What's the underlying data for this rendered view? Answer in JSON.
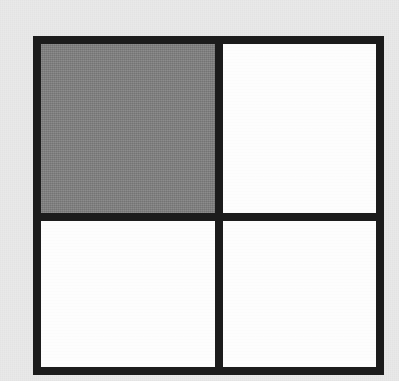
{
  "figure": {
    "kind": "fraction-area-model",
    "rows": 2,
    "columns": 2,
    "total_cells": 4,
    "shaded_cells": 1,
    "fraction": "1/4",
    "percent_shaded": 25,
    "colors": {
      "page_background": "#e9e9e9",
      "border": "#1c1c1c",
      "shaded_fill": "#808080",
      "empty_fill": "#fdfdfd"
    },
    "geometry": {
      "left": 33,
      "top": 36,
      "width": 351,
      "height": 339,
      "line_thickness": 8,
      "divider_x": 211,
      "divider_y": 209
    },
    "cells": [
      {
        "id": "cell-top-left",
        "row": 1,
        "column": 1,
        "position": "top-left",
        "state": "shaded",
        "fill": "#808080",
        "label": ""
      },
      {
        "id": "cell-top-right",
        "row": 1,
        "column": 2,
        "position": "top-right",
        "state": "empty",
        "fill": "#fdfdfd",
        "label": ""
      },
      {
        "id": "cell-bottom-left",
        "row": 2,
        "column": 1,
        "position": "bottom-left",
        "state": "empty",
        "fill": "#fdfdfd",
        "label": ""
      },
      {
        "id": "cell-bottom-right",
        "row": 2,
        "column": 2,
        "position": "bottom-right",
        "state": "empty",
        "fill": "#fdfdfd",
        "label": ""
      }
    ]
  }
}
